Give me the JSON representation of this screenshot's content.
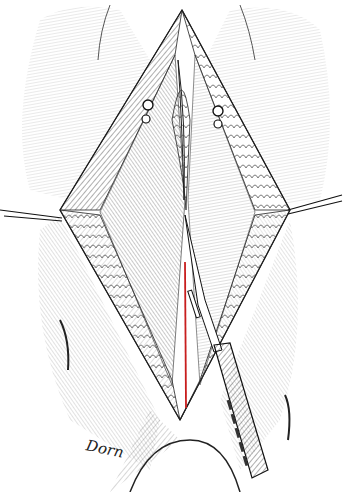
{
  "illustration": {
    "subject": "surgical illustration of midline incision with retraction sutures and scalpel",
    "signature": "Dorn",
    "colors": {
      "ink": "#1a1a1a",
      "background": "#ffffff",
      "incision": "#c81e1e"
    }
  }
}
